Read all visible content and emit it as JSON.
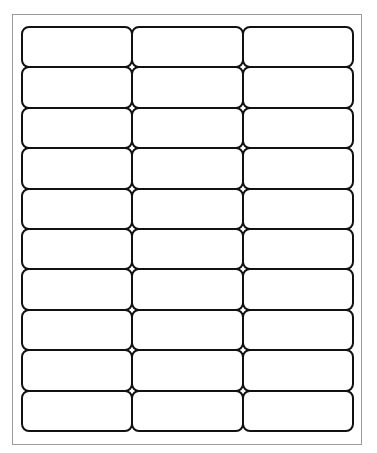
{
  "sheet": {
    "page_border_color": "#9a9a9a",
    "label_border_color": "#111111",
    "columns": 3,
    "rows": 10,
    "labels": [
      {
        "row": 1,
        "col": 1,
        "text": ""
      },
      {
        "row": 1,
        "col": 2,
        "text": ""
      },
      {
        "row": 1,
        "col": 3,
        "text": ""
      },
      {
        "row": 2,
        "col": 1,
        "text": ""
      },
      {
        "row": 2,
        "col": 2,
        "text": ""
      },
      {
        "row": 2,
        "col": 3,
        "text": ""
      },
      {
        "row": 3,
        "col": 1,
        "text": ""
      },
      {
        "row": 3,
        "col": 2,
        "text": ""
      },
      {
        "row": 3,
        "col": 3,
        "text": ""
      },
      {
        "row": 4,
        "col": 1,
        "text": ""
      },
      {
        "row": 4,
        "col": 2,
        "text": ""
      },
      {
        "row": 4,
        "col": 3,
        "text": ""
      },
      {
        "row": 5,
        "col": 1,
        "text": ""
      },
      {
        "row": 5,
        "col": 2,
        "text": ""
      },
      {
        "row": 5,
        "col": 3,
        "text": ""
      },
      {
        "row": 6,
        "col": 1,
        "text": ""
      },
      {
        "row": 6,
        "col": 2,
        "text": ""
      },
      {
        "row": 6,
        "col": 3,
        "text": ""
      },
      {
        "row": 7,
        "col": 1,
        "text": ""
      },
      {
        "row": 7,
        "col": 2,
        "text": ""
      },
      {
        "row": 7,
        "col": 3,
        "text": ""
      },
      {
        "row": 8,
        "col": 1,
        "text": ""
      },
      {
        "row": 8,
        "col": 2,
        "text": ""
      },
      {
        "row": 8,
        "col": 3,
        "text": ""
      },
      {
        "row": 9,
        "col": 1,
        "text": ""
      },
      {
        "row": 9,
        "col": 2,
        "text": ""
      },
      {
        "row": 9,
        "col": 3,
        "text": ""
      },
      {
        "row": 10,
        "col": 1,
        "text": ""
      },
      {
        "row": 10,
        "col": 2,
        "text": ""
      },
      {
        "row": 10,
        "col": 3,
        "text": ""
      }
    ]
  }
}
